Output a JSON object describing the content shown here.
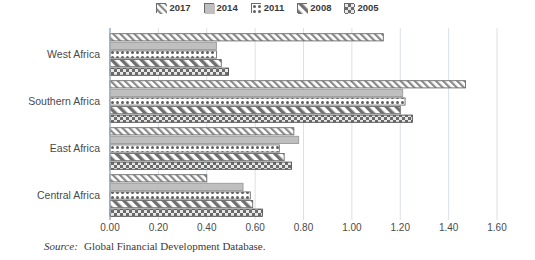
{
  "legend": {
    "position": "top-center",
    "entries": [
      {
        "label": "2017",
        "pattern": "diagonal-stripes",
        "color": "#ffffff",
        "edge": "#6b6b6b"
      },
      {
        "label": "2014",
        "pattern": "solid-gray",
        "color": "#bfbfbf",
        "edge": "#6b6b6b"
      },
      {
        "label": "2011",
        "pattern": "dotted",
        "color": "#ffffff",
        "edge": "#6b6b6b"
      },
      {
        "label": "2008",
        "pattern": "thick-diagonal",
        "color": "#ffffff",
        "edge": "#6b6b6b"
      },
      {
        "label": "2005",
        "pattern": "checkered",
        "color": "#6b6b6b",
        "edge": "#4a4a4a"
      }
    ]
  },
  "axis": {
    "x_ticks": [
      "0.00",
      "0.20",
      "0.40",
      "0.60",
      "0.80",
      "1.00",
      "1.20",
      "1.40",
      "1.60"
    ],
    "x_min": 0.0,
    "x_max": 1.6,
    "x_step": 0.2,
    "categories": [
      "West Africa",
      "Southern Africa",
      "East Africa",
      "Central Africa"
    ]
  },
  "source": {
    "label": "Source:",
    "text": "Global Financial Development Database."
  },
  "chart_data": {
    "type": "bar",
    "orientation": "horizontal",
    "title": "",
    "xlabel": "",
    "ylabel": "",
    "xlim": [
      0.0,
      1.6
    ],
    "grid": true,
    "legend_position": "top-center",
    "categories": [
      "West Africa",
      "Southern Africa",
      "East Africa",
      "Central Africa"
    ],
    "series": [
      {
        "name": "2017",
        "values": [
          1.13,
          1.47,
          0.76,
          0.4
        ]
      },
      {
        "name": "2014",
        "values": [
          0.44,
          1.21,
          0.78,
          0.55
        ]
      },
      {
        "name": "2011",
        "values": [
          0.44,
          1.22,
          0.7,
          0.58
        ]
      },
      {
        "name": "2008",
        "values": [
          0.46,
          1.2,
          0.72,
          0.59
        ]
      },
      {
        "name": "2005",
        "values": [
          0.49,
          1.25,
          0.75,
          0.63
        ]
      }
    ]
  }
}
